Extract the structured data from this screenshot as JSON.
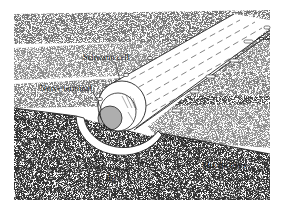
{
  "figure": {
    "labels": {
      "schwann_cell": "Schwann cell",
      "nerve_terminal": "Nerve terminal",
      "muscle_fiber": "Muscle fiber",
      "scale_bar": "1μ"
    },
    "colors": {
      "background": "#ffffff",
      "ink": "#222222",
      "stipple_light": "#9a9a9a",
      "stipple_dark": "#7a7a7a"
    }
  }
}
